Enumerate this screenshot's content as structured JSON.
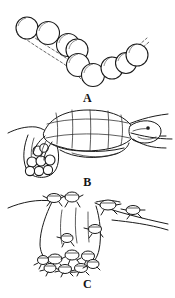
{
  "figure": {
    "background_color": "#ffffff",
    "ink_color": "#1a1a1a",
    "dash_color": "#555555",
    "width": 175,
    "height": 298
  },
  "panels": [
    {
      "id": "A",
      "label": "A",
      "caption": "Chain of turtle eggs arranged in a V, with dashed guide outline",
      "subject": "eggs",
      "egg_count": 9
    },
    {
      "id": "B",
      "label": "B",
      "caption": "Adult sea turtle on the beach depositing eggs into the nest chamber",
      "subject": "nesting-female-turtle",
      "eggs_in_nest": 8
    },
    {
      "id": "C",
      "label": "C",
      "caption": "Hatchlings emerging from the nest chamber and crawling across the sand",
      "subject": "hatchlings",
      "hatchlings_in_nest": 8,
      "hatchlings_on_surface": 5
    }
  ],
  "icons": {
    "egg": "egg-icon",
    "turtle": "turtle-icon",
    "hatchling": "hatchling-icon",
    "nest": "nest-cavity-icon",
    "sand_line": "sand-surface-icon"
  }
}
